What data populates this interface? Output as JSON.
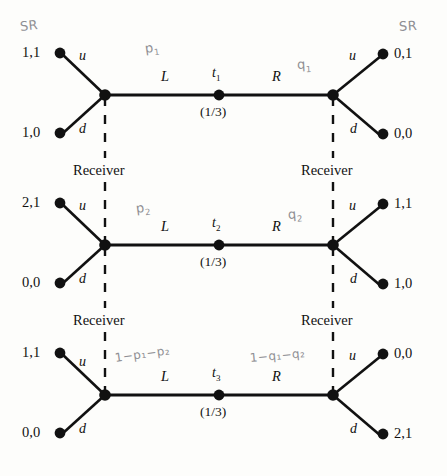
{
  "figure": {
    "ink_color": "#111111",
    "pencil_color": "#8f8f93",
    "background": "#fdfdfb"
  },
  "common": {
    "action_up": "u",
    "action_down": "d",
    "branch_left": "L",
    "branch_right": "R",
    "receiver_label": "Receiver",
    "nature_prob": "(1/3)"
  },
  "rows": [
    {
      "type_label": "t",
      "type_sub": "1",
      "prob": "(1/3)",
      "payoffs": {
        "left_up": "1,1",
        "left_down": "1,0",
        "right_up": "0,1",
        "right_down": "0,0"
      },
      "hand_left": "p",
      "hand_left_sub": "1",
      "hand_right": "q",
      "hand_right_sub": "1",
      "hand_corner_left": "SR",
      "hand_corner_right": "SR"
    },
    {
      "type_label": "t",
      "type_sub": "2",
      "prob": "(1/3)",
      "payoffs": {
        "left_up": "2,1",
        "left_down": "0,0",
        "right_up": "1,1",
        "right_down": "1,0"
      },
      "hand_left": "p",
      "hand_left_sub": "2",
      "hand_right": "q",
      "hand_right_sub": "2",
      "hand_corner_left": "",
      "hand_corner_right": ""
    },
    {
      "type_label": "t",
      "type_sub": "3",
      "prob": "(1/3)",
      "payoffs": {
        "left_up": "1,1",
        "left_down": "0,0",
        "right_up": "0,0",
        "right_down": "2,1"
      },
      "hand_left": "1−p₁−p₂",
      "hand_left_sub": "",
      "hand_right": "1−q₁−q₂",
      "hand_right_sub": "",
      "hand_corner_left": "",
      "hand_corner_right": ""
    }
  ],
  "receivers": [
    {
      "label": "Receiver",
      "side": "left"
    },
    {
      "label": "Receiver",
      "side": "right"
    },
    {
      "label": "Receiver",
      "side": "left"
    },
    {
      "label": "Receiver",
      "side": "right"
    }
  ]
}
